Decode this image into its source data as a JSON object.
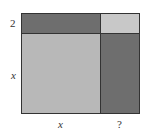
{
  "diagram": {
    "type": "area-model-completing-the-square",
    "colors": {
      "dark": "#6e6e6e",
      "light": "#b8b8b8",
      "top_right": "#c8c8c8",
      "outline": "#333333"
    },
    "regions": [
      {
        "id": "top-left",
        "description": "x by 2 rectangle",
        "color": "dark"
      },
      {
        "id": "top-right",
        "description": "? by 2 rectangle",
        "color": "top_right"
      },
      {
        "id": "bottom-left",
        "description": "x by x square",
        "color": "light"
      },
      {
        "id": "bottom-right",
        "description": "? by x rectangle",
        "color": "dark"
      }
    ],
    "labels": {
      "left_top": "2",
      "left_bottom": "x",
      "bottom_left": "x",
      "bottom_right": "?"
    }
  }
}
